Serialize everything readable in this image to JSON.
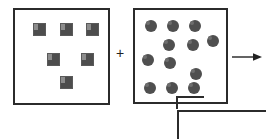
{
  "diagram": {
    "operator": "+",
    "arrow_label": "",
    "stroke_color": "#2b2b2b",
    "shape_color": "#4d4d4d",
    "background_color": "#ffffff"
  },
  "left_set": {
    "name": "square-set",
    "shape_kind": "square",
    "count": 6,
    "items": [
      {
        "label": "square-1",
        "x": 18,
        "y": 13
      },
      {
        "label": "square-2",
        "x": 45,
        "y": 13
      },
      {
        "label": "square-3",
        "x": 71,
        "y": 13
      },
      {
        "label": "square-4",
        "x": 32,
        "y": 43
      },
      {
        "label": "square-5",
        "x": 66,
        "y": 43
      },
      {
        "label": "square-6",
        "x": 45,
        "y": 66
      }
    ]
  },
  "right_set": {
    "name": "circle-set",
    "shape_kind": "circle",
    "count": 12,
    "items": [
      {
        "label": "circle-1",
        "x": 10,
        "y": 10
      },
      {
        "label": "circle-2",
        "x": 32,
        "y": 10
      },
      {
        "label": "circle-3",
        "x": 54,
        "y": 10
      },
      {
        "label": "circle-4",
        "x": 72,
        "y": 25
      },
      {
        "label": "circle-5",
        "x": 28,
        "y": 29
      },
      {
        "label": "circle-6",
        "x": 52,
        "y": 29
      },
      {
        "label": "circle-7",
        "x": 7,
        "y": 44
      },
      {
        "label": "circle-8",
        "x": 29,
        "y": 47
      },
      {
        "label": "circle-9",
        "x": 55,
        "y": 58
      },
      {
        "label": "circle-10",
        "x": 9,
        "y": 72
      },
      {
        "label": "circle-11",
        "x": 31,
        "y": 72
      },
      {
        "label": "circle-12",
        "x": 53,
        "y": 72
      }
    ]
  },
  "result_set": {
    "name": "result-box",
    "visible_portion": "partial",
    "count_text": ""
  },
  "chart_data": {
    "type": "bar",
    "categories": [
      "squares",
      "circles"
    ],
    "values": [
      6,
      12
    ],
    "xlabel": "",
    "ylabel": "",
    "ylim": [
      0,
      12
    ]
  }
}
